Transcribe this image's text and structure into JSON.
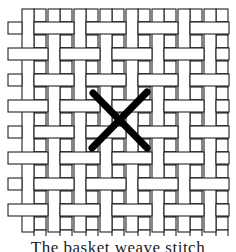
{
  "figure": {
    "type": "basket-weave-canvas-diagram",
    "grid": {
      "origin_x": 8,
      "origin_y": 9,
      "strand_width": 12,
      "period": 26,
      "columns": 9,
      "rows": 9,
      "right_edge": 229,
      "bottom_edge": 232
    },
    "stroke_color": "#222222",
    "fill_color": "#ffffff",
    "stitch_mark": {
      "symbol": "X",
      "color": "#000000",
      "stroke_width": 7,
      "line1": [
        93,
        93,
        147,
        148
      ],
      "line2": [
        147,
        92,
        92,
        148
      ]
    }
  },
  "caption": {
    "text": "The basket weave stitch"
  }
}
